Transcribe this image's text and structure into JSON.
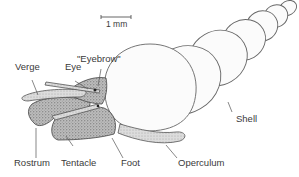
{
  "figure": {
    "scale_bar": {
      "label": "1 mm"
    },
    "labels": {
      "verge": "Verge",
      "eye": "Eye",
      "eyebrow": "\"Eyebrow\"",
      "shell": "Shell",
      "rostrum": "Rostrum",
      "tentacle": "Tentacle",
      "foot": "Foot",
      "operculum": "Operculum"
    },
    "colors": {
      "line": "#555555",
      "text": "#3a3a3a",
      "background": "#ffffff"
    }
  }
}
